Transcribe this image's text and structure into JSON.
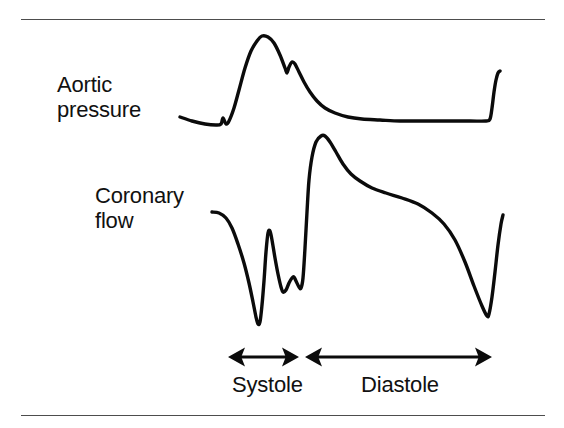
{
  "figure": {
    "background_color": "#ffffff",
    "rule_color": "#4d4d4d",
    "trace_color": "#0b0b0b",
    "rules": [
      {
        "name": "top-rule",
        "y": 19
      },
      {
        "name": "bottom-rule",
        "y": 415
      }
    ]
  },
  "labels": {
    "aortic_pressure_line1": "Aortic",
    "aortic_pressure_line2": "pressure",
    "coronary_flow_line1": "Coronary",
    "coronary_flow_line2": "flow",
    "systole": "Systole",
    "diastole": "Diastole"
  },
  "annotations": {
    "systole_arrow": {
      "name": "systole-double-arrow",
      "x_start": 228,
      "x_end": 299,
      "y": 357,
      "double_headed": true
    },
    "diastole_arrow": {
      "name": "diastole-double-arrow",
      "x_start": 305,
      "x_end": 492,
      "y": 357,
      "double_headed": true
    }
  },
  "chart_data": {
    "type": "line",
    "xlabel": "",
    "ylabel": "",
    "grid": false,
    "legend_position": "inline-left-labels",
    "axis_note": "No numeric axes are drawn; traces are qualitative waveforms over one cardiac cycle.",
    "phases": [
      {
        "name": "Systole",
        "x_start": 228,
        "x_end": 299
      },
      {
        "name": "Diastole",
        "x_start": 305,
        "x_end": 492
      }
    ],
    "series": [
      {
        "name": "Aortic pressure",
        "stroke": "#0b0b0b",
        "points": [
          [
            180,
            117
          ],
          [
            192,
            121
          ],
          [
            205,
            124
          ],
          [
            216,
            125
          ],
          [
            221,
            124
          ],
          [
            223,
            118
          ],
          [
            226,
            124
          ],
          [
            229,
            121
          ],
          [
            234,
            108
          ],
          [
            239,
            90
          ],
          [
            245,
            68
          ],
          [
            251,
            51
          ],
          [
            257,
            41
          ],
          [
            262,
            36
          ],
          [
            268,
            37
          ],
          [
            274,
            43
          ],
          [
            280,
            55
          ],
          [
            285,
            68
          ],
          [
            287,
            73
          ],
          [
            289,
            67
          ],
          [
            292,
            62
          ],
          [
            295,
            64
          ],
          [
            299,
            72
          ],
          [
            304,
            82
          ],
          [
            310,
            92
          ],
          [
            317,
            101
          ],
          [
            325,
            108
          ],
          [
            335,
            113
          ],
          [
            348,
            117
          ],
          [
            362,
            119
          ],
          [
            380,
            120
          ],
          [
            400,
            121
          ],
          [
            420,
            121
          ],
          [
            445,
            121
          ],
          [
            470,
            121
          ],
          [
            486,
            121
          ],
          [
            490,
            119
          ],
          [
            492,
            108
          ],
          [
            494,
            92
          ],
          [
            496,
            80
          ],
          [
            498,
            73
          ],
          [
            500,
            71
          ]
        ]
      },
      {
        "name": "Coronary flow",
        "stroke": "#0b0b0b",
        "points": [
          [
            212,
            212
          ],
          [
            219,
            213
          ],
          [
            226,
            218
          ],
          [
            232,
            228
          ],
          [
            238,
            244
          ],
          [
            244,
            263
          ],
          [
            249,
            283
          ],
          [
            253,
            302
          ],
          [
            256,
            317
          ],
          [
            258,
            324
          ],
          [
            260,
            322
          ],
          [
            262,
            305
          ],
          [
            264,
            281
          ],
          [
            266,
            252
          ],
          [
            268,
            233
          ],
          [
            270,
            231
          ],
          [
            272,
            240
          ],
          [
            275,
            258
          ],
          [
            278,
            274
          ],
          [
            281,
            287
          ],
          [
            283,
            292
          ],
          [
            286,
            290
          ],
          [
            289,
            283
          ],
          [
            292,
            278
          ],
          [
            294,
            277
          ],
          [
            296,
            281
          ],
          [
            299,
            287
          ],
          [
            301,
            288
          ],
          [
            303,
            278
          ],
          [
            305,
            248
          ],
          [
            307,
            212
          ],
          [
            309,
            180
          ],
          [
            312,
            157
          ],
          [
            316,
            142
          ],
          [
            321,
            136
          ],
          [
            325,
            136
          ],
          [
            330,
            142
          ],
          [
            336,
            152
          ],
          [
            343,
            164
          ],
          [
            351,
            174
          ],
          [
            360,
            181
          ],
          [
            372,
            188
          ],
          [
            386,
            193
          ],
          [
            402,
            198
          ],
          [
            418,
            204
          ],
          [
            432,
            213
          ],
          [
            444,
            224
          ],
          [
            455,
            240
          ],
          [
            465,
            262
          ],
          [
            474,
            286
          ],
          [
            482,
            306
          ],
          [
            487,
            316
          ],
          [
            489,
            314
          ],
          [
            492,
            297
          ],
          [
            495,
            272
          ],
          [
            498,
            245
          ],
          [
            501,
            224
          ],
          [
            503,
            215
          ]
        ]
      }
    ]
  }
}
